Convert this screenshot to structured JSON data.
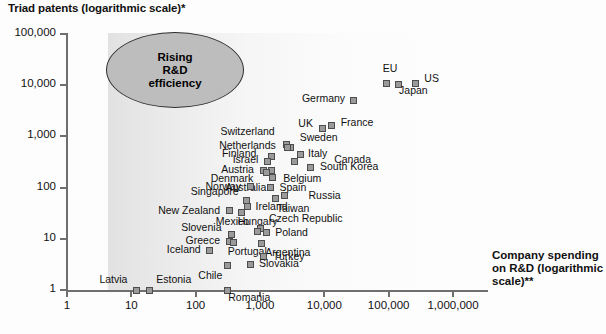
{
  "chart_data": {
    "type": "scatter",
    "title": "",
    "ylabel": "Triad patents (logarithmic scale)*",
    "xlabel": "Company spending on R&D (logarithmic scale)**",
    "xscale": "log",
    "yscale": "log",
    "xlim": [
      1,
      1000000
    ],
    "ylim": [
      1,
      100000
    ],
    "grid": false,
    "legend": "none",
    "xticks": [
      "1",
      "10",
      "100",
      "1,000",
      "10,000",
      "100,000",
      "1,000,000"
    ],
    "yticks": [
      "1",
      "10",
      "100",
      "1,000",
      "10,000",
      "100,000"
    ],
    "annotation": "Rising R&D efficiency",
    "annotation_lines": [
      "Rising",
      "R&D",
      "efficiency"
    ],
    "points": [
      {
        "name": "US",
        "x": 260000,
        "y": 11000
      },
      {
        "name": "EU",
        "x": 93000,
        "y": 11000
      },
      {
        "name": "Japan",
        "x": 140000,
        "y": 10500
      },
      {
        "name": "Germany",
        "x": 28000,
        "y": 5000
      },
      {
        "name": "France",
        "x": 13000,
        "y": 1600
      },
      {
        "name": "UK",
        "x": 9500,
        "y": 1400
      },
      {
        "name": "Switzerland",
        "x": 2600,
        "y": 700
      },
      {
        "name": "Sweden",
        "x": 3000,
        "y": 620
      },
      {
        "name": "Netherlands",
        "x": 2700,
        "y": 600
      },
      {
        "name": "Italy",
        "x": 4200,
        "y": 440
      },
      {
        "name": "Finland",
        "x": 1500,
        "y": 400
      },
      {
        "name": "Canada",
        "x": 3400,
        "y": 330
      },
      {
        "name": "Israel",
        "x": 1300,
        "y": 330
      },
      {
        "name": "South Korea",
        "x": 6200,
        "y": 250
      },
      {
        "name": "Austria",
        "x": 1150,
        "y": 220
      },
      {
        "name": "Belgium",
        "x": 1500,
        "y": 220
      },
      {
        "name": "Denmark",
        "x": 1250,
        "y": 200
      },
      {
        "name": "Australia",
        "x": 1550,
        "y": 160
      },
      {
        "name": "Norway",
        "x": 700,
        "y": 105
      },
      {
        "name": "Spain",
        "x": 1450,
        "y": 100
      },
      {
        "name": "Russia",
        "x": 2400,
        "y": 70
      },
      {
        "name": "Singapore",
        "x": 620,
        "y": 55
      },
      {
        "name": "Taiwan",
        "x": 1750,
        "y": 62
      },
      {
        "name": "Ireland",
        "x": 640,
        "y": 42
      },
      {
        "name": "New Zealand",
        "x": 330,
        "y": 35
      },
      {
        "name": "Hungary",
        "x": 520,
        "y": 33
      },
      {
        "name": "Czech Republic",
        "x": 1000,
        "y": 16
      },
      {
        "name": "Mexico",
        "x": 900,
        "y": 14
      },
      {
        "name": "Poland",
        "x": 1250,
        "y": 13
      },
      {
        "name": "Slovenia",
        "x": 360,
        "y": 12
      },
      {
        "name": "Greece",
        "x": 330,
        "y": 9
      },
      {
        "name": "Portugal",
        "x": 390,
        "y": 8.5
      },
      {
        "name": "Argentina",
        "x": 1050,
        "y": 8
      },
      {
        "name": "Iceland",
        "x": 165,
        "y": 6
      },
      {
        "name": "Turkey",
        "x": 1150,
        "y": 4.5
      },
      {
        "name": "Chile",
        "x": 310,
        "y": 3
      },
      {
        "name": "Slovakia",
        "x": 700,
        "y": 3.2
      },
      {
        "name": "Latvia",
        "x": 12,
        "y": 1
      },
      {
        "name": "Estonia",
        "x": 19,
        "y": 1
      },
      {
        "name": "Romania",
        "x": 310,
        "y": 1
      }
    ]
  },
  "labels": {
    "yaxis_title": "Triad patents (logarithmic scale)*",
    "xaxis_title": "Company spending on R&D (logarithmic scale)**"
  }
}
